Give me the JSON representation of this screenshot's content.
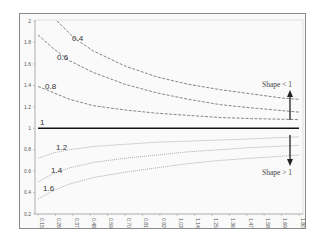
{
  "chart_data": {
    "type": "line",
    "title": "",
    "xlabel": "",
    "ylabel": "",
    "x_ticks": [
      "0.15",
      "0.26",
      "0.37",
      "0.48",
      "0.59",
      "0.70",
      "0.81",
      "0.92",
      "1.03",
      "1.14",
      "1.25",
      "1.36",
      "1.47",
      "1.58",
      "1.69",
      "1.80"
    ],
    "y_ticks": [
      "2",
      "1.8",
      "1.6",
      "1.4",
      "1.2",
      "1",
      "0.8",
      "0.6",
      "0.4",
      "0.2"
    ],
    "xlim": [
      0.15,
      1.8
    ],
    "ylim": [
      0.2,
      2.0
    ],
    "grid": false,
    "legend": null,
    "series": [
      {
        "name": "0.4",
        "style": "dashed",
        "x": [
          0.27,
          0.38,
          0.5,
          0.7,
          0.9,
          1.1,
          1.3,
          1.5,
          1.7,
          1.8
        ],
        "values": [
          2.0,
          1.84,
          1.72,
          1.58,
          1.48,
          1.41,
          1.36,
          1.32,
          1.28,
          1.27
        ]
      },
      {
        "name": "0.6",
        "style": "dashed",
        "x": [
          0.15,
          0.25,
          0.35,
          0.5,
          0.7,
          0.9,
          1.1,
          1.3,
          1.5,
          1.8
        ],
        "values": [
          1.87,
          1.74,
          1.63,
          1.52,
          1.41,
          1.33,
          1.27,
          1.22,
          1.19,
          1.15
        ]
      },
      {
        "name": "0.8",
        "style": "dashed",
        "x": [
          0.15,
          0.25,
          0.35,
          0.5,
          0.7,
          0.9,
          1.1,
          1.3,
          1.5,
          1.8
        ],
        "values": [
          1.39,
          1.33,
          1.27,
          1.21,
          1.17,
          1.14,
          1.12,
          1.1,
          1.09,
          1.08
        ]
      },
      {
        "name": "1",
        "style": "solid",
        "x": [
          0.15,
          1.8
        ],
        "values": [
          1.0,
          1.0
        ]
      },
      {
        "name": "1.2",
        "style": "dotted",
        "x": [
          0.15,
          0.25,
          0.35,
          0.5,
          0.7,
          0.9,
          1.1,
          1.3,
          1.5,
          1.8
        ],
        "values": [
          0.72,
          0.77,
          0.8,
          0.83,
          0.85,
          0.87,
          0.88,
          0.89,
          0.9,
          0.92
        ]
      },
      {
        "name": "1.4",
        "style": "dotted",
        "x": [
          0.15,
          0.25,
          0.35,
          0.5,
          0.7,
          0.9,
          1.1,
          1.3,
          1.5,
          1.8
        ],
        "values": [
          0.5,
          0.58,
          0.63,
          0.68,
          0.72,
          0.75,
          0.78,
          0.8,
          0.82,
          0.84
        ]
      },
      {
        "name": "1.6",
        "style": "dotted",
        "x": [
          0.15,
          0.25,
          0.35,
          0.5,
          0.7,
          0.9,
          1.1,
          1.3,
          1.5,
          1.8
        ],
        "values": [
          0.34,
          0.42,
          0.48,
          0.54,
          0.59,
          0.63,
          0.67,
          0.7,
          0.72,
          0.75
        ]
      }
    ],
    "annotations": [
      {
        "text": "Shape < 1",
        "arrow": "up",
        "x": 1.78,
        "y": 1.35
      },
      {
        "text": "Shape > 1",
        "arrow": "down",
        "x": 1.78,
        "y": 0.65
      }
    ]
  },
  "labels": {
    "curve_04": "0.4",
    "curve_06": "0.6",
    "curve_08": "0.8",
    "curve_1": "1",
    "curve_12": "1.2",
    "curve_14": "1.4",
    "curve_16": "1.6",
    "shape_lt": "Shape < 1",
    "shape_gt": "Shape > 1"
  }
}
